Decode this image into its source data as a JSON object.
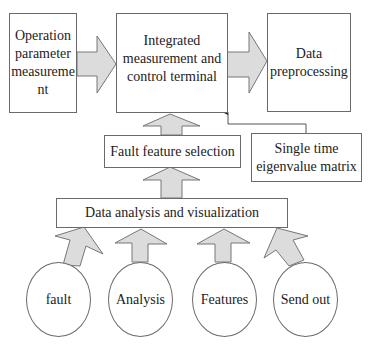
{
  "diagram": {
    "boxes": {
      "operation": "Operation\nparameter\nmeasureme\nnt",
      "terminal": "Integrated\nmeasurement and\ncontrol terminal",
      "preprocessing": "Data\npreprocessing",
      "fault_feature": "Fault feature selection",
      "single_time": "Single time\neigenvalue matrix",
      "data_analysis": "Data analysis and visualization"
    },
    "circles": [
      "fault",
      "Analysis",
      "Features",
      "Send out"
    ],
    "colors": {
      "arrow_fill": "#dcdcdc",
      "stroke": "#6a6a6a"
    }
  }
}
